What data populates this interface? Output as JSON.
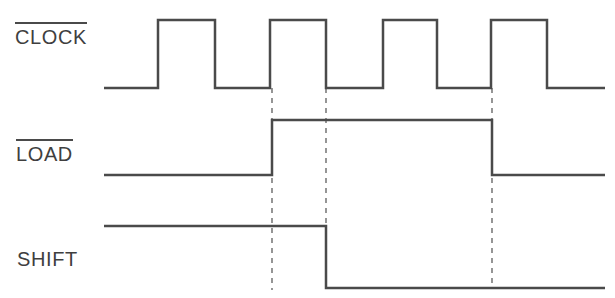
{
  "diagram": {
    "background_color": "#ffffff",
    "stroke_color": "#4a4a4a",
    "text_color": "#3f3f3f",
    "stroke_width": 2.5,
    "width": 615,
    "height": 298
  },
  "signals": [
    {
      "name": "clock",
      "label": "CLOCK",
      "overline": true,
      "label_x": 15,
      "label_y": 22,
      "low_y": 88,
      "high_y": 20,
      "start_x": 104,
      "end_x": 605,
      "pulses": [
        {
          "rise_x": 158,
          "fall_x": 215
        },
        {
          "rise_x": 270,
          "fall_x": 326
        },
        {
          "rise_x": 383,
          "fall_x": 437
        },
        {
          "rise_x": 491,
          "fall_x": 547
        }
      ],
      "path": "M 104 88 L 158 88 L 158 20 L 215 20 L 215 88 L 270 88 L 270 20 L 326 20 L 326 88 L 383 88 L 383 20 L 437 20 L 437 88 L 491 88 L 491 20 L 547 20 L 547 88 L 605 88"
    },
    {
      "name": "load",
      "label": "LOAD",
      "overline": true,
      "label_x": 16,
      "label_y": 139,
      "low_y": 175,
      "high_y": 120,
      "start_x": 104,
      "end_x": 605,
      "rise_x": 272,
      "fall_x": 492,
      "path": "M 104 175 L 272 175 L 272 120 L 492 120 L 492 175 L 605 175"
    },
    {
      "name": "shift",
      "label": "SHIFT",
      "overline": false,
      "label_x": 17,
      "label_y": 244,
      "low_y": 288,
      "high_y": 226,
      "start_x": 104,
      "end_x": 605,
      "fall_x": 326,
      "path": "M 104 226 L 326 226 L 326 288 L 605 288"
    }
  ],
  "markers": [
    {
      "name": "marker-load-assert",
      "x": 272,
      "y_top": 88,
      "y_bottom": 290
    },
    {
      "name": "marker-shift-deassert",
      "x": 326,
      "y_top": 88,
      "y_bottom": 228
    },
    {
      "name": "marker-load-deassert",
      "x": 492,
      "y_top": 88,
      "y_bottom": 288
    }
  ],
  "marker_style": {
    "dash": "5 5",
    "color": "#6a6a6a",
    "width": 1.4
  }
}
